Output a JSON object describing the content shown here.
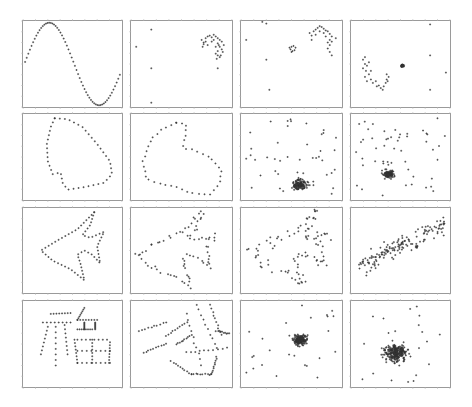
{
  "figure": {
    "rows": 4,
    "cols": 4,
    "background": "#ffffff",
    "frame_color": "#9a9a9a",
    "point_color": "#333333"
  },
  "chart_data": [
    {
      "type": "scatter",
      "row": 0,
      "col": 0,
      "title": "",
      "xlabel": "",
      "ylabel": "",
      "grid": false,
      "description": "sine wave (one full period)",
      "generator": "sine",
      "n": 60
    },
    {
      "type": "scatter",
      "row": 0,
      "col": 1,
      "title": "",
      "grid": false,
      "description": "arc cluster upper-right with few outliers",
      "points": [
        [
          0.7,
          0.22
        ],
        [
          0.72,
          0.25
        ],
        [
          0.74,
          0.2
        ],
        [
          0.76,
          0.18
        ],
        [
          0.78,
          0.17
        ],
        [
          0.8,
          0.19
        ],
        [
          0.82,
          0.16
        ],
        [
          0.84,
          0.18
        ],
        [
          0.86,
          0.2
        ],
        [
          0.88,
          0.22
        ],
        [
          0.9,
          0.24
        ],
        [
          0.86,
          0.26
        ],
        [
          0.88,
          0.3
        ],
        [
          0.9,
          0.33
        ],
        [
          0.86,
          0.35
        ],
        [
          0.84,
          0.38
        ],
        [
          0.86,
          0.4
        ],
        [
          0.88,
          0.42
        ],
        [
          0.85,
          0.44
        ],
        [
          0.84,
          0.3
        ],
        [
          0.8,
          0.24
        ],
        [
          0.76,
          0.28
        ],
        [
          0.72,
          0.27
        ],
        [
          0.71,
          0.3
        ],
        [
          0.74,
          0.24
        ],
        [
          0.92,
          0.28
        ],
        [
          0.91,
          0.36
        ],
        [
          0.89,
          0.4
        ],
        [
          0.82,
          0.22
        ],
        [
          0.87,
          0.28
        ],
        [
          0.86,
          0.55
        ],
        [
          0.2,
          0.1
        ],
        [
          0.05,
          0.3
        ],
        [
          0.2,
          0.55
        ],
        [
          0.2,
          0.95
        ]
      ]
    },
    {
      "type": "scatter",
      "row": 0,
      "col": 2,
      "title": "",
      "grid": false,
      "description": "arc cluster upper-right, small ring at center, outliers",
      "points": [
        [
          0.68,
          0.14
        ],
        [
          0.7,
          0.17
        ],
        [
          0.72,
          0.12
        ],
        [
          0.74,
          0.1
        ],
        [
          0.76,
          0.08
        ],
        [
          0.78,
          0.06
        ],
        [
          0.8,
          0.07
        ],
        [
          0.82,
          0.09
        ],
        [
          0.84,
          0.11
        ],
        [
          0.86,
          0.12
        ],
        [
          0.88,
          0.15
        ],
        [
          0.9,
          0.18
        ],
        [
          0.88,
          0.22
        ],
        [
          0.86,
          0.25
        ],
        [
          0.88,
          0.28
        ],
        [
          0.86,
          0.32
        ],
        [
          0.88,
          0.36
        ],
        [
          0.9,
          0.24
        ],
        [
          0.74,
          0.16
        ],
        [
          0.78,
          0.12
        ],
        [
          0.82,
          0.14
        ],
        [
          0.84,
          0.18
        ],
        [
          0.7,
          0.22
        ],
        [
          0.94,
          0.2
        ],
        [
          0.9,
          0.4
        ],
        [
          0.5,
          0.3
        ],
        [
          0.52,
          0.29
        ],
        [
          0.54,
          0.31
        ],
        [
          0.53,
          0.34
        ],
        [
          0.51,
          0.35
        ],
        [
          0.49,
          0.33
        ],
        [
          0.48,
          0.31
        ],
        [
          0.5,
          0.36
        ],
        [
          0.25,
          0.03
        ],
        [
          0.21,
          0.01
        ],
        [
          0.05,
          0.22
        ],
        [
          0.25,
          0.45
        ],
        [
          0.28,
          0.8
        ]
      ]
    },
    {
      "type": "scatter",
      "row": 0,
      "col": 3,
      "title": "",
      "grid": false,
      "description": "dense blob at center, curved band lower-left, outliers",
      "generator": "blob",
      "cx": 0.52,
      "cy": 0.52,
      "spread": 0.02,
      "n": 30,
      "points": [
        [
          0.12,
          0.45
        ],
        [
          0.14,
          0.5
        ],
        [
          0.16,
          0.52
        ],
        [
          0.12,
          0.55
        ],
        [
          0.15,
          0.58
        ],
        [
          0.18,
          0.62
        ],
        [
          0.14,
          0.65
        ],
        [
          0.16,
          0.7
        ],
        [
          0.2,
          0.68
        ],
        [
          0.22,
          0.72
        ],
        [
          0.25,
          0.7
        ],
        [
          0.28,
          0.75
        ],
        [
          0.3,
          0.78
        ],
        [
          0.33,
          0.76
        ],
        [
          0.35,
          0.72
        ],
        [
          0.36,
          0.68
        ],
        [
          0.38,
          0.65
        ],
        [
          0.36,
          0.62
        ],
        [
          0.18,
          0.48
        ],
        [
          0.2,
          0.58
        ],
        [
          0.26,
          0.76
        ],
        [
          0.32,
          0.8
        ],
        [
          0.37,
          0.7
        ],
        [
          0.14,
          0.42
        ],
        [
          0.8,
          0.04
        ],
        [
          0.8,
          0.4
        ],
        [
          0.96,
          0.6
        ],
        [
          0.8,
          0.8
        ]
      ]
    },
    {
      "type": "scatter",
      "row": 1,
      "col": 0,
      "title": "",
      "grid": false,
      "description": "closed loop outline shape",
      "generator": "loop1",
      "n": 48
    },
    {
      "type": "scatter",
      "row": 1,
      "col": 1,
      "title": "",
      "grid": false,
      "description": "noisier closed loop outline",
      "generator": "loop2",
      "n": 46
    },
    {
      "type": "scatter",
      "row": 1,
      "col": 2,
      "title": "",
      "grid": false,
      "description": "dense cluster bottom-center with scattered points",
      "generator": "cluster",
      "cx": 0.58,
      "cy": 0.82,
      "spread": 0.07,
      "n": 130,
      "scatter_n": 45,
      "seed": 7
    },
    {
      "type": "scatter",
      "row": 1,
      "col": 3,
      "title": "",
      "grid": false,
      "description": "dense cluster center-left with scattered points",
      "generator": "cluster",
      "cx": 0.38,
      "cy": 0.7,
      "spread": 0.06,
      "n": 120,
      "scatter_n": 55,
      "seed": 11
    },
    {
      "type": "scatter",
      "row": 2,
      "col": 0,
      "title": "",
      "grid": false,
      "description": "fish/arrow outline",
      "generator": "fish",
      "n": 70
    },
    {
      "type": "scatter",
      "row": 2,
      "col": 1,
      "title": "",
      "grid": false,
      "description": "noisy fish/arrow outline",
      "generator": "fishnoisy",
      "n": 80,
      "seed": 3
    },
    {
      "type": "scatter",
      "row": 2,
      "col": 2,
      "title": "",
      "grid": false,
      "description": "heavily perturbed fish outline",
      "generator": "fishnoisy2",
      "n": 95,
      "seed": 5
    },
    {
      "type": "scatter",
      "row": 2,
      "col": 3,
      "title": "",
      "grid": false,
      "description": "scattered band rising right",
      "generator": "band",
      "n": 150,
      "seed": 9
    },
    {
      "type": "scatter",
      "row": 3,
      "col": 0,
      "title": "",
      "grid": false,
      "description": "Chinese character glyph made of dots",
      "generator": "glyph",
      "n": 120
    },
    {
      "type": "scatter",
      "row": 3,
      "col": 1,
      "title": "",
      "grid": false,
      "description": "rotated/sheared glyph of dots",
      "generator": "glyph2",
      "n": 120
    },
    {
      "type": "scatter",
      "row": 3,
      "col": 2,
      "title": "",
      "grid": false,
      "description": "dense cluster center with spread",
      "generator": "cluster",
      "cx": 0.58,
      "cy": 0.45,
      "spread": 0.08,
      "n": 170,
      "scatter_n": 25,
      "seed": 13
    },
    {
      "type": "scatter",
      "row": 3,
      "col": 3,
      "title": "",
      "grid": false,
      "description": "broad diffuse cluster",
      "generator": "cluster",
      "cx": 0.45,
      "cy": 0.6,
      "spread": 0.13,
      "n": 260,
      "scatter_n": 20,
      "seed": 17
    }
  ],
  "layout": {
    "col_x": [
      22,
      130,
      240,
      350
    ],
    "col_w": [
      101,
      103,
      103,
      101
    ],
    "row_y": [
      20,
      113,
      207,
      300
    ],
    "row_h": [
      88,
      88,
      87,
      88
    ]
  }
}
